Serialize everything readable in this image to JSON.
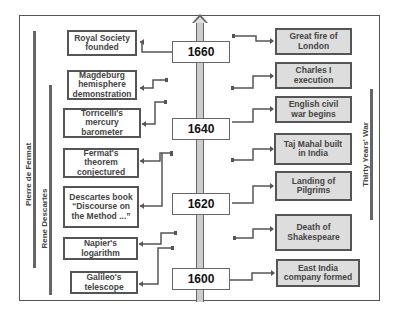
{
  "years": [
    {
      "label": "1660",
      "top": 41
    },
    {
      "label": "1640",
      "top": 118
    },
    {
      "label": "1620",
      "top": 193
    },
    {
      "label": "1600",
      "top": 268
    }
  ],
  "left_events": [
    {
      "label": "Royal Society\nfounded",
      "x": 67,
      "y": 30,
      "w": 70,
      "h": 26
    },
    {
      "label": "Magdeburg\nhemisphere\ndemonstration",
      "x": 67,
      "y": 70,
      "w": 70,
      "h": 30
    },
    {
      "label": "Torricelli's\nmercury\nbarometer",
      "x": 63,
      "y": 108,
      "w": 78,
      "h": 30
    },
    {
      "label": "Fermat's\ntheorem\nconjectured",
      "x": 63,
      "y": 148,
      "w": 76,
      "h": 30
    },
    {
      "label": "Descartes book\n“Discourse on\nthe Method ...”",
      "x": 63,
      "y": 186,
      "w": 76,
      "h": 42
    },
    {
      "label": "Napier's\nlogarithm",
      "x": 63,
      "y": 237,
      "w": 75,
      "h": 23
    },
    {
      "label": "Galileo's\ntelescope",
      "x": 70,
      "y": 271,
      "w": 68,
      "h": 23
    }
  ],
  "right_events": [
    {
      "label": "Great fire of\nLondon",
      "x": 275,
      "y": 28,
      "w": 77,
      "h": 27
    },
    {
      "label": "Charles I\nexecution",
      "x": 275,
      "y": 62,
      "w": 77,
      "h": 27
    },
    {
      "label": "English civil\nwar begins",
      "x": 275,
      "y": 96,
      "w": 77,
      "h": 27
    },
    {
      "label": "Taj Mahal built\nin India",
      "x": 274,
      "y": 133,
      "w": 78,
      "h": 32
    },
    {
      "label": "Landing of\nPilgrims",
      "x": 275,
      "y": 171,
      "w": 77,
      "h": 30
    },
    {
      "label": "Death of\nShakespeare",
      "x": 275,
      "y": 214,
      "w": 77,
      "h": 37
    },
    {
      "label": "East India\ncompany formed",
      "x": 276,
      "y": 259,
      "w": 84,
      "h": 28
    }
  ],
  "lifespans": [
    {
      "label": "Pierre de Fermat",
      "bar_x": 33,
      "bar_top": 31,
      "bar_h": 237,
      "label_x": 28,
      "label_y": 175
    },
    {
      "label": "Rene Descartes",
      "bar_x": 49,
      "bar_top": 85,
      "bar_h": 210,
      "label_x": 44,
      "label_y": 218
    },
    {
      "label": "Thirty Years' War",
      "bar_x": 370,
      "bar_top": 89,
      "bar_h": 131,
      "label_x": 364,
      "label_y": 155
    }
  ]
}
